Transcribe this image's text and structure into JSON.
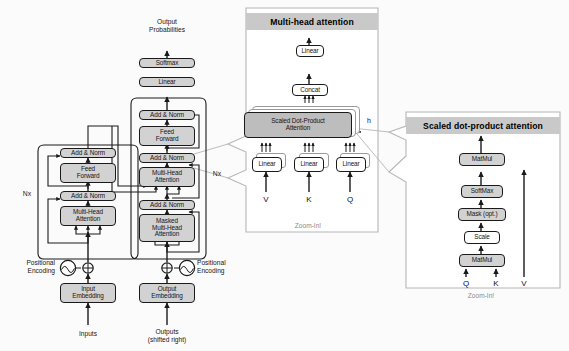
{
  "encoder": {
    "nx_label": "Nx",
    "blocks": [
      {
        "id": "enc-add-norm-2",
        "label": "Add & Norm"
      },
      {
        "id": "enc-feed-forward",
        "label": "Feed\nForward",
        "line1": "Feed",
        "line2": "Forward"
      },
      {
        "id": "enc-add-norm-1",
        "label": "Add & Norm"
      },
      {
        "id": "enc-multi-head",
        "line1": "Multi-Head",
        "line2": "Attention"
      }
    ],
    "embedding": {
      "line1": "Input",
      "line2": "Embedding"
    },
    "positional_encoding": {
      "line1": "Positional",
      "line2": "Encoding"
    },
    "input_label": "Inputs"
  },
  "decoder": {
    "nx_label": "Nx",
    "blocks": [
      {
        "id": "dec-add-norm-3",
        "label": "Add & Norm"
      },
      {
        "id": "dec-feed-forward",
        "line1": "Feed",
        "line2": "Forward"
      },
      {
        "id": "dec-add-norm-2",
        "label": "Add & Norm"
      },
      {
        "id": "dec-multi-head",
        "line1": "Multi-Head",
        "line2": "Attention"
      },
      {
        "id": "dec-add-norm-1",
        "label": "Add & Norm"
      },
      {
        "id": "dec-masked-multi-head",
        "line1": "Masked",
        "line2": "Multi-Head",
        "line3": "Attention"
      }
    ],
    "linear": "Linear",
    "softmax": "Softmax",
    "embedding": {
      "line1": "Output",
      "line2": "Embedding"
    },
    "positional_encoding": {
      "line1": "Positional",
      "line2": "Encoding"
    },
    "output_label": {
      "line1": "Outputs",
      "line2": "(shifted right)"
    },
    "top_label": {
      "line1": "Output",
      "line2": "Probabilities"
    }
  },
  "multi_head_panel": {
    "title": "Multi-head attention",
    "caption": "Zoom-In!",
    "linear_top": "Linear",
    "concat": "Concat",
    "core": {
      "line1": "Scaled Dot-Product",
      "line2": "Attention"
    },
    "heads_label": "h",
    "linear_v": "Linear",
    "linear_k": "Linear",
    "linear_q": "Linear",
    "input_v": "V",
    "input_k": "K",
    "input_q": "Q"
  },
  "scaled_panel": {
    "title": "Scaled dot-product attention",
    "caption": "Zoom-In!",
    "matmul_top": "MatMul",
    "softmax": "SoftMax",
    "mask": "Mask (opt.)",
    "scale": "Scale",
    "matmul_bottom": "MatMul",
    "input_q": "Q",
    "input_k": "K",
    "input_v": "V"
  },
  "colors": {
    "node_fill": "#d2d2d2",
    "node_fill_dark": "#bdbdbd",
    "node_fill_white": "#ffffff",
    "panel_title_bg": "#c9c9c9",
    "stroke": "#1a1a1a",
    "callout_stroke": "#b6b6b6",
    "caption_text": "#8a8a8a"
  }
}
